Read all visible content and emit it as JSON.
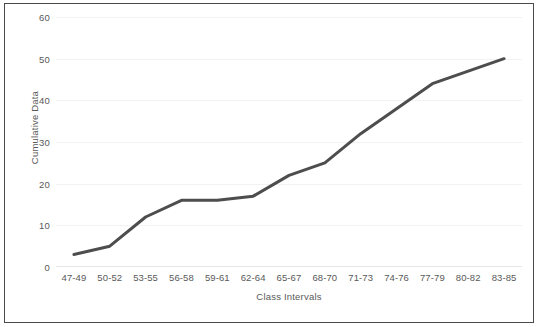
{
  "chart_data": {
    "type": "line",
    "title": "",
    "subtitle": "",
    "xlabel": "Class Intervals",
    "ylabel": "Cumulative Data",
    "categories": [
      "47-49",
      "50-52",
      "53-55",
      "56-58",
      "59-61",
      "62-64",
      "65-67",
      "68-70",
      "71-73",
      "74-76",
      "77-79",
      "80-82",
      "83-85"
    ],
    "values": [
      3,
      5,
      12,
      16,
      16,
      17,
      22,
      25,
      32,
      38,
      44,
      47,
      50
    ],
    "series": [
      {
        "name": "Cumulative Data",
        "values": [
          3,
          5,
          12,
          16,
          16,
          17,
          22,
          25,
          32,
          38,
          44,
          47,
          50
        ]
      }
    ],
    "ylim": [
      0,
      60
    ],
    "yticks": [
      0,
      10,
      20,
      30,
      40,
      50,
      60
    ],
    "ytick_labels": [
      "0",
      "10",
      "20",
      "30",
      "40",
      "50",
      "60"
    ],
    "grid": true,
    "grid_axis": "y",
    "legend": false,
    "legend_position": "none",
    "line_color": "#4d4d4d",
    "line_width": 3,
    "markers": false,
    "plot_background": "#ffffff",
    "grid_color": "#f2f2f2",
    "tick_label_color": "#595959",
    "border_color": "#4a4a4a",
    "annotations": []
  }
}
